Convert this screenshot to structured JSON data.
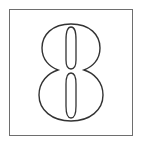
{
  "card": {
    "digit": "8",
    "style": "outlined-numeral",
    "border_color": "#6e6e6e",
    "stroke_color": "#333333",
    "background": "#ffffff"
  }
}
